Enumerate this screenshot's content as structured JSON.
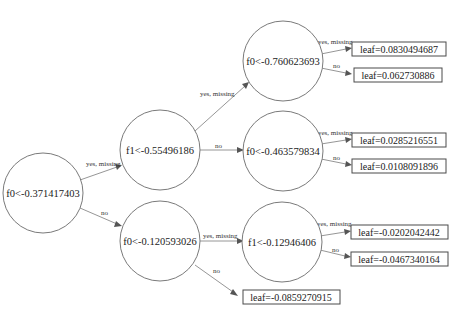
{
  "diagram": {
    "type": "decision-tree",
    "nodes": {
      "root": {
        "label": "f0<-0.371417403"
      },
      "n1": {
        "label": "f1<-0.55496186"
      },
      "n2": {
        "label": "f0<-0.120593026"
      },
      "n3": {
        "label": "f0<-0.760623693"
      },
      "n4": {
        "label": "f0<-0.463579834"
      },
      "n5": {
        "label": "f1<-0.12946406"
      }
    },
    "leaves": {
      "l1": {
        "label": "leaf=0.0830494687"
      },
      "l2": {
        "label": "leaf=0.062730886"
      },
      "l3": {
        "label": "leaf=0.0285216551"
      },
      "l4": {
        "label": "leaf=0.0108091896"
      },
      "l5": {
        "label": "leaf=-0.0202042442"
      },
      "l6": {
        "label": "leaf=-0.0467340164"
      },
      "l7": {
        "label": "leaf=-0.0859270915"
      }
    },
    "edges": {
      "root_n1": "yes, missing",
      "root_n2": "no",
      "n1_n3": "yes, missing",
      "n1_n4": "no",
      "n2_n5": "yes, missing",
      "n2_l7": "no",
      "n3_l1": "yes, missing",
      "n3_l2": "no",
      "n4_l3": "yes, missing",
      "n4_l4": "no",
      "n5_l5": "yes, missing",
      "n5_l6": "no"
    }
  }
}
